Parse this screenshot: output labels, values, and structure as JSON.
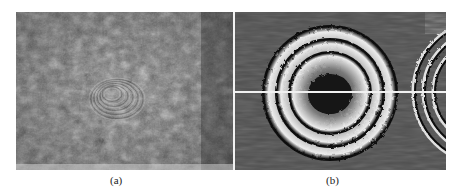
{
  "figure": {
    "panels": [
      {
        "label": "(a)",
        "description": "Raw speckle interferogram with faint concentric fringes",
        "fringe_center": {
          "x": 110,
          "y": 92
        }
      },
      {
        "label": "(b)",
        "description": "Filtered phase map showing concentric ring fringes with horizontal profile line",
        "fringe_center": {
          "x": 330,
          "y": 95
        },
        "ring_count": 3,
        "profile_line_y": 92
      }
    ],
    "colors": {
      "background": "#ffffff",
      "panel_a_base": "#6b6b6b",
      "panel_b_base": "#4a4a4a",
      "fringe_light": "#e8e8e8",
      "fringe_dark": "#111111",
      "profile_line": "#f0f0f0"
    }
  }
}
